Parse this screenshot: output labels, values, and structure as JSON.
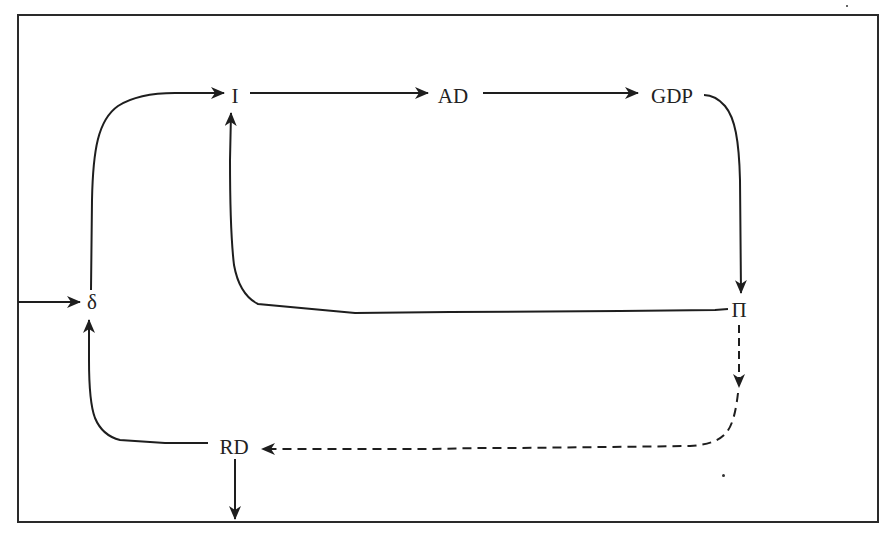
{
  "diagram": {
    "type": "causal-flow-diagram",
    "nodes": {
      "I": {
        "label": "I",
        "x": 235,
        "y": 96
      },
      "AD": {
        "label": "AD",
        "x": 453,
        "y": 96
      },
      "GDP": {
        "label": "GDP",
        "x": 672,
        "y": 96
      },
      "delta": {
        "label": "δ",
        "x": 92,
        "y": 302
      },
      "Pi": {
        "label": "Π",
        "x": 739,
        "y": 310
      },
      "RD": {
        "label": "RD",
        "x": 234,
        "y": 447
      }
    },
    "edges": [
      {
        "from": "external",
        "to": "δ",
        "style": "solid"
      },
      {
        "from": "δ",
        "to": "I",
        "style": "solid"
      },
      {
        "from": "I",
        "to": "AD",
        "style": "solid"
      },
      {
        "from": "AD",
        "to": "GDP",
        "style": "solid"
      },
      {
        "from": "GDP",
        "to": "Π",
        "style": "solid"
      },
      {
        "from": "Π",
        "to": "I",
        "style": "solid"
      },
      {
        "from": "Π",
        "to": "RD",
        "style": "dashed"
      },
      {
        "from": "RD",
        "to": "δ",
        "style": "solid"
      },
      {
        "from": "RD",
        "to": "external",
        "style": "solid"
      }
    ],
    "colors": {
      "line": "#1e1e1e",
      "frame": "#2a2a2a",
      "background": "#ffffff"
    }
  }
}
